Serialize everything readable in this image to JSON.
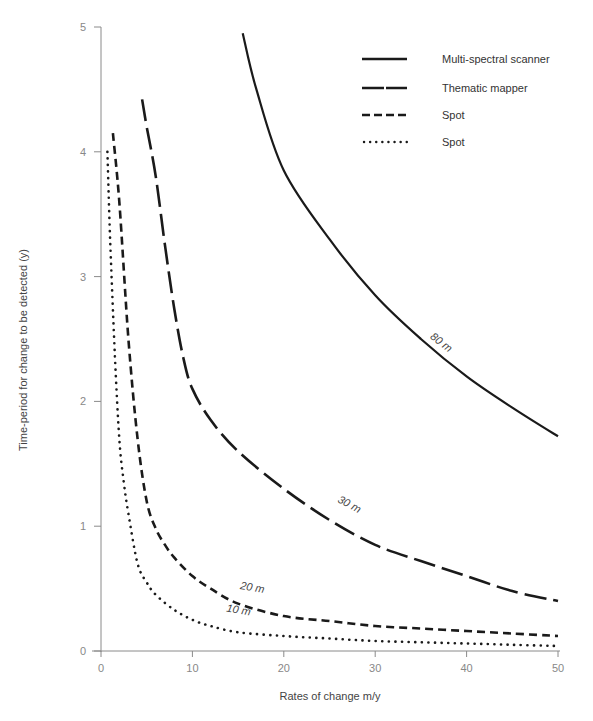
{
  "chart_data": {
    "type": "line",
    "title": "",
    "xlabel": "Rates of change m/y",
    "ylabel": "Time-period for change to be detected (y)",
    "xlim": [
      0,
      50
    ],
    "ylim": [
      0,
      5
    ],
    "x_ticks": [
      0,
      10,
      20,
      30,
      40,
      50
    ],
    "y_ticks": [
      0,
      1,
      2,
      3,
      4,
      5
    ],
    "grid": false,
    "legend_position": "top-right",
    "series": [
      {
        "name": "Multi-spectral scanner",
        "resolution_label": "80 m",
        "style": "solid",
        "x": [
          15.5,
          17,
          20,
          25,
          30,
          35,
          40,
          45,
          50
        ],
        "y": [
          4.95,
          4.5,
          3.85,
          3.3,
          2.85,
          2.5,
          2.2,
          1.95,
          1.72
        ]
      },
      {
        "name": "Thematic mapper",
        "resolution_label": "30 m",
        "style": "long-dash",
        "x": [
          4.5,
          5,
          6,
          7,
          8,
          9,
          10,
          12,
          15,
          20,
          25,
          30,
          35,
          40,
          45,
          50
        ],
        "y": [
          4.42,
          4.2,
          3.8,
          3.25,
          2.75,
          2.35,
          2.1,
          1.85,
          1.6,
          1.3,
          1.05,
          0.85,
          0.72,
          0.6,
          0.48,
          0.4
        ]
      },
      {
        "name": "Spot",
        "resolution_label": "20 m",
        "style": "short-dash",
        "x": [
          1.3,
          2,
          3,
          4,
          5,
          6,
          7,
          8,
          10,
          12,
          15,
          20,
          25,
          30,
          35,
          40,
          45,
          50
        ],
        "y": [
          4.15,
          3.6,
          2.5,
          1.7,
          1.2,
          0.98,
          0.85,
          0.75,
          0.6,
          0.5,
          0.38,
          0.28,
          0.24,
          0.2,
          0.18,
          0.16,
          0.14,
          0.12
        ]
      },
      {
        "name": "Spot",
        "resolution_label": "10 m",
        "style": "dotted",
        "x": [
          0.7,
          1,
          1.5,
          2,
          2.5,
          3,
          4,
          5,
          6,
          8,
          10,
          12,
          15,
          20,
          25,
          30,
          35,
          40,
          45,
          50
        ],
        "y": [
          4.0,
          3.3,
          2.4,
          1.7,
          1.35,
          1.1,
          0.7,
          0.55,
          0.45,
          0.33,
          0.25,
          0.2,
          0.15,
          0.12,
          0.1,
          0.08,
          0.07,
          0.06,
          0.05,
          0.04
        ]
      }
    ],
    "annotations": [
      {
        "text": "80 m",
        "x": 37,
        "y": 2.45,
        "angle": 38
      },
      {
        "text": "30 m",
        "x": 27,
        "y": 1.15,
        "angle": 28
      },
      {
        "text": "20 m",
        "x": 16.5,
        "y": 0.48,
        "angle": 10
      },
      {
        "text": "10 m",
        "x": 15,
        "y": 0.3,
        "angle": 10
      }
    ]
  },
  "legend": {
    "items": [
      {
        "label": "Multi-spectral scanner",
        "style": "solid"
      },
      {
        "label": "Thematic mapper",
        "style": "long-dash"
      },
      {
        "label": "Spot",
        "style": "short-dash"
      },
      {
        "label": "Spot",
        "style": "dotted"
      }
    ]
  },
  "axes": {
    "x_title": "Rates of change m/y",
    "y_title": "Time-period for change to be detected (y)",
    "x_tick_labels": [
      "0",
      "10",
      "20",
      "30",
      "40",
      "50"
    ],
    "y_tick_labels": [
      "0",
      "1",
      "2",
      "3",
      "4",
      "5"
    ]
  },
  "colors": {
    "line": "#1a1a1a",
    "axis": "#8a8a8a",
    "tick_text": "#888888"
  }
}
